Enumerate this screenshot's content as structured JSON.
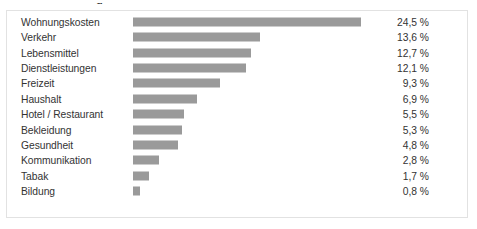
{
  "figure": {
    "title_remnant": "g",
    "frame_border_color": "#e2e2e2",
    "background_color": "#ffffff",
    "bar_color": "#9a9a9a",
    "text_color": "#333333",
    "value_suffix": "%"
  },
  "chart_data": {
    "type": "bar",
    "orientation": "horizontal",
    "title": "",
    "xlabel": "",
    "ylabel": "",
    "xlim": [
      0,
      24.5
    ],
    "grid": false,
    "legend": null,
    "value_format": "german-decimal-comma",
    "unit": "%",
    "categories": [
      "Wohnungskosten",
      "Verkehr",
      "Lebensmittel",
      "Dienstleistungen",
      "Freizeit",
      "Haushalt",
      "Hotel / Restaurant",
      "Bekleidung",
      "Gesundheit",
      "Kommunikation",
      "Tabak",
      "Bildung"
    ],
    "values": [
      24.5,
      13.6,
      12.7,
      12.1,
      9.3,
      6.9,
      5.5,
      5.3,
      4.8,
      2.8,
      1.7,
      0.8
    ],
    "value_labels": [
      "24,5 %",
      "13,6 %",
      "12,7 %",
      "12,1 %",
      "9,3 %",
      "6,9 %",
      "5,5 %",
      "5,3 %",
      "4,8 %",
      "2,8 %",
      "1,7 %",
      "0,8 %"
    ]
  }
}
